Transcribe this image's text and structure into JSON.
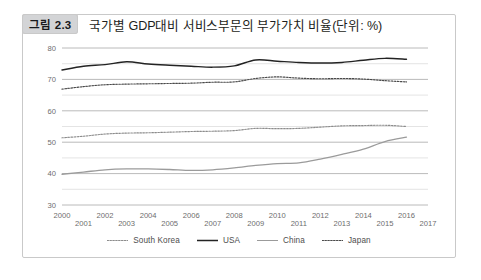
{
  "figure": {
    "badge": "그림 2.3",
    "title": "국가별 GDP대비 서비스부문의 부가가치 비율(단위: %)"
  },
  "legend": {
    "position": "bottom-center",
    "items": [
      {
        "label": "South Korea",
        "style": "dotted",
        "color": "#8c8c8c",
        "icon": "dotted-line-icon"
      },
      {
        "label": "USA",
        "style": "solid-bold",
        "color": "#232323",
        "icon": "solid-line-icon"
      },
      {
        "label": "China",
        "style": "solid",
        "color": "#9b9b9b",
        "icon": "solid-line-icon"
      },
      {
        "label": "Japan",
        "style": "dotted",
        "color": "#4a4a4a",
        "icon": "dotted-line-icon"
      }
    ]
  },
  "chart_data": {
    "type": "line",
    "title": "국가별 GDP대비 서비스부문의 부가가치 비율(단위: %)",
    "xlabel": "",
    "ylabel": "",
    "unit": "%",
    "grid": true,
    "grid_major_step": 10,
    "grid_minor_step": 5,
    "legend_position": "bottom-center",
    "xlim": [
      2000,
      2017
    ],
    "ylim": [
      30,
      80
    ],
    "yticks": [
      80,
      70,
      60,
      50,
      40,
      30
    ],
    "x": [
      2000,
      2001,
      2002,
      2003,
      2004,
      2005,
      2006,
      2007,
      2008,
      2009,
      2010,
      2011,
      2012,
      2013,
      2014,
      2015,
      2016
    ],
    "xticks": [
      "2000",
      "2001",
      "2002",
      "2003",
      "2004",
      "2005",
      "2006",
      "2007",
      "2008",
      "2009",
      "2010",
      "2011",
      "2012",
      "2013",
      "2014",
      "2015",
      "2016",
      "2017"
    ],
    "series": [
      {
        "name": "South Korea",
        "style": "dotted",
        "color": "#8c8c8c",
        "values": [
          51.4,
          51.9,
          52.6,
          52.9,
          53.0,
          53.2,
          53.4,
          53.5,
          53.7,
          54.4,
          54.3,
          54.4,
          54.8,
          55.2,
          55.3,
          55.4,
          55.0
        ]
      },
      {
        "name": "USA",
        "style": "solid-bold",
        "color": "#232323",
        "values": [
          73.0,
          74.2,
          74.7,
          75.6,
          74.9,
          74.5,
          74.2,
          73.9,
          74.3,
          76.2,
          75.8,
          75.4,
          75.2,
          75.4,
          76.1,
          76.7,
          76.4
        ]
      },
      {
        "name": "China",
        "style": "solid",
        "color": "#9b9b9b",
        "values": [
          39.8,
          40.5,
          41.2,
          41.5,
          41.5,
          41.3,
          41.0,
          41.2,
          41.8,
          42.6,
          43.2,
          43.4,
          44.6,
          46.1,
          47.8,
          50.2,
          51.6
        ]
      },
      {
        "name": "Japan",
        "style": "dotted",
        "color": "#4a4a4a",
        "values": [
          66.9,
          67.7,
          68.3,
          68.5,
          68.6,
          68.7,
          68.8,
          69.1,
          69.2,
          70.3,
          70.8,
          70.4,
          70.2,
          70.3,
          70.1,
          69.6,
          69.2
        ]
      }
    ]
  }
}
